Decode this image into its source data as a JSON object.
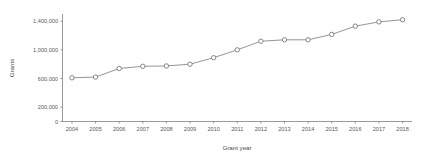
{
  "chart_data": {
    "type": "line",
    "title": "",
    "subtitle": "",
    "xlabel": "Grant year",
    "ylabel": "Grants",
    "categories": [
      "2004",
      "2005",
      "2006",
      "2007",
      "2008",
      "2009",
      "2010",
      "2011",
      "2012",
      "2013",
      "2014",
      "2015",
      "2016",
      "2017",
      "2018"
    ],
    "x": [
      2004,
      2005,
      2006,
      2007,
      2008,
      2009,
      2010,
      2011,
      2012,
      2013,
      2014,
      2015,
      2016,
      2017,
      2018
    ],
    "values": [
      610000,
      620000,
      740000,
      770000,
      775000,
      800000,
      890000,
      1000000,
      1120000,
      1140000,
      1140000,
      1215000,
      1330000,
      1390000,
      1420000
    ],
    "series": [
      {
        "name": "Grants",
        "values": [
          610000,
          620000,
          740000,
          770000,
          775000,
          800000,
          890000,
          1000000,
          1120000,
          1140000,
          1140000,
          1215000,
          1330000,
          1390000,
          1420000
        ]
      }
    ],
    "xlim": [
      2003.6,
      2018.4
    ],
    "ylim": [
      0,
      1500000
    ],
    "ytick_values": [
      0,
      200000,
      600000,
      1000000,
      1400000
    ],
    "ytick_labels": [
      "0",
      "200,000",
      "600,000",
      "1,000,000",
      "1,400,000"
    ],
    "xtick_labels": [
      "2004",
      "2005",
      "2006",
      "2007",
      "2008",
      "2009",
      "2010",
      "2011",
      "2012",
      "2013",
      "2014",
      "2015",
      "2016",
      "2017",
      "2018"
    ],
    "grid": false,
    "legend": false,
    "legend_position": "none",
    "marker": "open-circle",
    "line_color": "#7a7a7a",
    "marker_fill": "#ffffff",
    "marker_edge": "#6a6a6a",
    "axis_color": "#6e6e6e",
    "background": "#ffffff"
  }
}
